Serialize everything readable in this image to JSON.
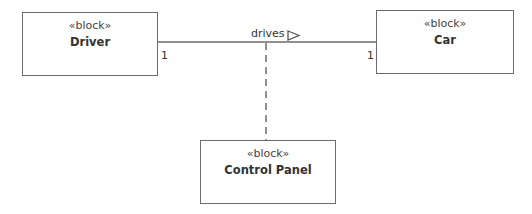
{
  "diagram": {
    "type": "SysML block definition",
    "blocks": [
      {
        "id": "driver",
        "stereotype": "«block»",
        "name": "Driver"
      },
      {
        "id": "car",
        "stereotype": "«block»",
        "name": "Car"
      },
      {
        "id": "control_panel",
        "stereotype": "«block»",
        "name": "Control Panel"
      }
    ],
    "association": {
      "name": "drives",
      "direction_indicator": "open-triangle-right",
      "from": "Driver",
      "to": "Car",
      "multiplicity_source": "1",
      "multiplicity_target": "1"
    },
    "association_class_link": {
      "style": "dashed",
      "connects": "Control Panel"
    },
    "colors": {
      "line": "#6b6b6b",
      "text": "#333333",
      "background": "#ffffff"
    }
  }
}
